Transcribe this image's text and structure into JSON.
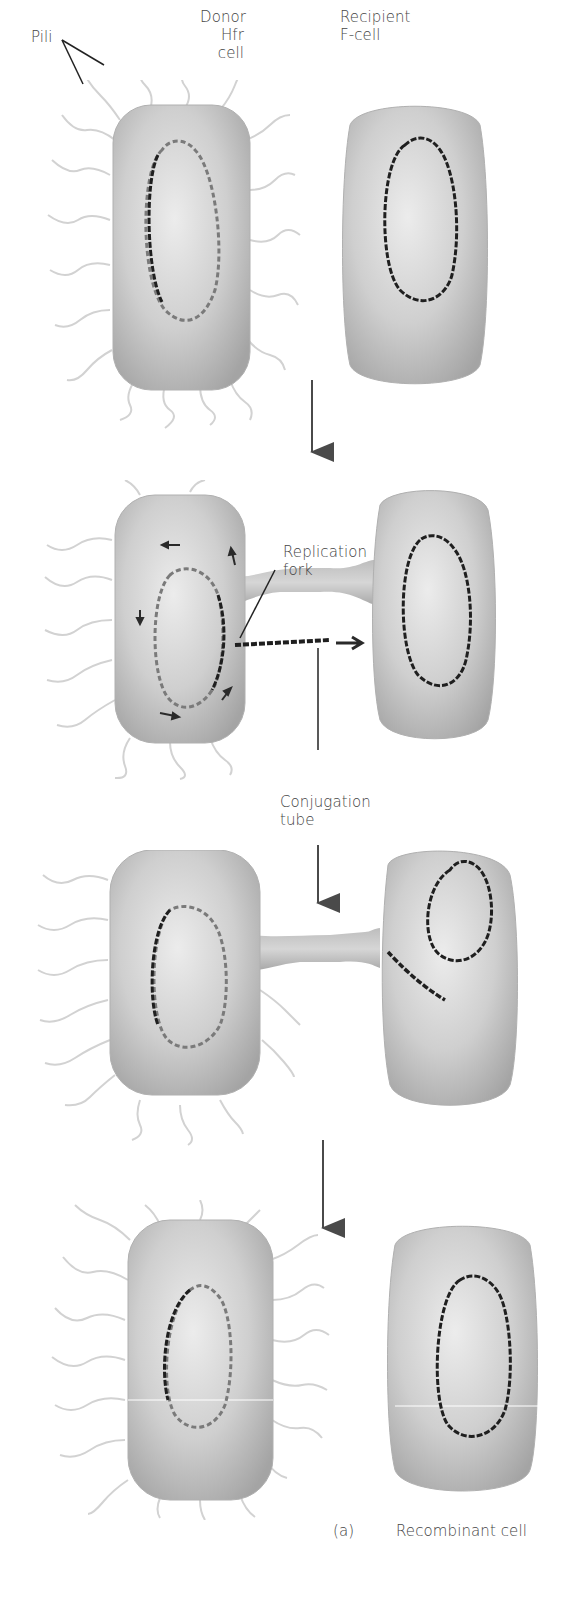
{
  "figure": {
    "panel_label": "(a)",
    "colors": {
      "cell_fill": "#c9c9c9",
      "cell_highlight": "#e6e6e6",
      "cell_shadow": "#9e9e9e",
      "dna_dark": "#1e1e1e",
      "dna_light": "#7d7d7d",
      "pili": "#d4d4d4",
      "arrow": "#4a4a4a"
    }
  },
  "labels": {
    "pili": "Pili",
    "donor_line1": "Donor",
    "donor_line2": "Hfr",
    "donor_line3": "cell",
    "recipient_line1": "Recipient",
    "recipient_line2": "F-cell",
    "replication_line1": "Replication",
    "replication_line2": "fork",
    "conjugation_line1": "Conjugation",
    "conjugation_line2": "tube",
    "recombinant": "Recombinant cell"
  },
  "stages": [
    {
      "id": 1,
      "description": "Donor Hfr cell with pili and recipient F- cell, separate"
    },
    {
      "id": 2,
      "description": "Cells joined by conjugation tube; DNA replicating and transferring"
    },
    {
      "id": 3,
      "description": "Transferred DNA strand enters recipient cell"
    },
    {
      "id": 4,
      "description": "Cells separate; recipient becomes recombinant cell"
    }
  ]
}
